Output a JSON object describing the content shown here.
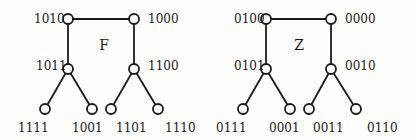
{
  "diagram": {
    "trees": [
      {
        "name": "F",
        "title_pos": [
          104,
          50
        ],
        "nodes": [
          {
            "id": "1010",
            "label": "1010",
            "x": 68,
            "y": 19,
            "lx": 34,
            "ly": 23,
            "anchor": "start"
          },
          {
            "id": "1000",
            "label": "1000",
            "x": 134,
            "y": 19,
            "lx": 148,
            "ly": 23,
            "anchor": "start"
          },
          {
            "id": "1011",
            "label": "1011",
            "x": 68,
            "y": 69,
            "lx": 36,
            "ly": 70,
            "anchor": "start"
          },
          {
            "id": "1100",
            "label": "1100",
            "x": 134,
            "y": 69,
            "lx": 148,
            "ly": 70,
            "anchor": "start"
          },
          {
            "id": "1111",
            "label": "1111",
            "x": 45,
            "y": 109,
            "lx": 18,
            "ly": 132,
            "anchor": "start"
          },
          {
            "id": "1001",
            "label": "1001",
            "x": 92,
            "y": 109,
            "lx": 72,
            "ly": 132,
            "anchor": "start"
          },
          {
            "id": "1101",
            "label": "1101",
            "x": 111,
            "y": 109,
            "lx": 116,
            "ly": 132,
            "anchor": "start"
          },
          {
            "id": "1110",
            "label": "1110",
            "x": 158,
            "y": 109,
            "lx": 165,
            "ly": 132,
            "anchor": "start"
          }
        ],
        "edges": [
          [
            "1010",
            "1000"
          ],
          [
            "1010",
            "1011"
          ],
          [
            "1000",
            "1100"
          ],
          [
            "1011",
            "1111"
          ],
          [
            "1011",
            "1001"
          ],
          [
            "1100",
            "1101"
          ],
          [
            "1100",
            "1110"
          ]
        ]
      },
      {
        "name": "Z",
        "title_pos": [
          299,
          50
        ],
        "nodes": [
          {
            "id": "0100",
            "label": "0100",
            "x": 266,
            "y": 19,
            "lx": 234,
            "ly": 23,
            "anchor": "start"
          },
          {
            "id": "0000",
            "label": "0000",
            "x": 331,
            "y": 19,
            "lx": 345,
            "ly": 23,
            "anchor": "start"
          },
          {
            "id": "0101",
            "label": "0101",
            "x": 266,
            "y": 69,
            "lx": 234,
            "ly": 70,
            "anchor": "start"
          },
          {
            "id": "0010",
            "label": "0010",
            "x": 331,
            "y": 69,
            "lx": 345,
            "ly": 70,
            "anchor": "start"
          },
          {
            "id": "0111",
            "label": "0111",
            "x": 243,
            "y": 109,
            "lx": 216,
            "ly": 132,
            "anchor": "start"
          },
          {
            "id": "0001",
            "label": "0001",
            "x": 290,
            "y": 109,
            "lx": 269,
            "ly": 132,
            "anchor": "start"
          },
          {
            "id": "0011",
            "label": "0011",
            "x": 309,
            "y": 109,
            "lx": 313,
            "ly": 132,
            "anchor": "start"
          },
          {
            "id": "0110",
            "label": "0110",
            "x": 356,
            "y": 109,
            "lx": 367,
            "ly": 132,
            "anchor": "start"
          }
        ],
        "edges": [
          [
            "0100",
            "0000"
          ],
          [
            "0100",
            "0101"
          ],
          [
            "0000",
            "0010"
          ],
          [
            "0101",
            "0111"
          ],
          [
            "0101",
            "0001"
          ],
          [
            "0010",
            "0011"
          ],
          [
            "0010",
            "0110"
          ]
        ]
      }
    ],
    "node_radius": 5,
    "colors": {
      "stroke": "#1a1a1a",
      "node_fill": "#ffffff",
      "background": "#fdfdfc"
    }
  }
}
